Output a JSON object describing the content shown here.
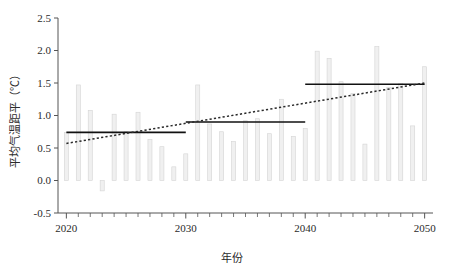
{
  "chart_data": {
    "type": "bar",
    "title": "",
    "xlabel": "年份",
    "ylabel": "平均气温距平（℃）",
    "xlim": [
      2019.3,
      2050.7
    ],
    "ylim": [
      -0.5,
      2.5
    ],
    "grid": false,
    "legend": null,
    "x_ticks_major": [
      "2020",
      "2030",
      "2040",
      "2050"
    ],
    "x_ticks_major_values": [
      2020,
      2030,
      2040,
      2050
    ],
    "y_ticks": [
      "-0.5",
      "0.0",
      "0.5",
      "1.0",
      "1.5",
      "2.0",
      "2.5"
    ],
    "y_tick_values": [
      -0.5,
      0.0,
      0.5,
      1.0,
      1.5,
      2.0,
      2.5
    ],
    "categories": [
      2020,
      2021,
      2022,
      2023,
      2024,
      2025,
      2026,
      2027,
      2028,
      2029,
      2030,
      2031,
      2032,
      2033,
      2034,
      2035,
      2036,
      2037,
      2038,
      2039,
      2040,
      2041,
      2042,
      2043,
      2044,
      2045,
      2046,
      2047,
      2048,
      2049,
      2050
    ],
    "values": [
      0.74,
      1.47,
      1.08,
      -0.16,
      1.02,
      0.75,
      1.05,
      0.63,
      0.52,
      0.21,
      0.41,
      1.47,
      0.87,
      0.75,
      0.6,
      0.92,
      0.95,
      0.72,
      1.25,
      0.68,
      0.8,
      1.99,
      1.88,
      1.52,
      1.34,
      0.56,
      2.06,
      1.43,
      1.49,
      0.84,
      1.75
    ],
    "series": [
      {
        "name": "平均气温距平",
        "type": "bar",
        "values": [
          0.74,
          1.47,
          1.08,
          -0.16,
          1.02,
          0.75,
          1.05,
          0.63,
          0.52,
          0.21,
          0.41,
          1.47,
          0.87,
          0.75,
          0.6,
          0.92,
          0.95,
          0.72,
          1.25,
          0.68,
          0.8,
          1.99,
          1.88,
          1.52,
          1.34,
          0.56,
          2.06,
          1.43,
          1.49,
          0.84,
          1.75
        ]
      },
      {
        "name": "阶段平均值",
        "type": "step-segments",
        "segments": [
          {
            "x_start": 2020,
            "x_end": 2030,
            "value": 0.74
          },
          {
            "x_start": 2030,
            "x_end": 2040,
            "value": 0.9
          },
          {
            "x_start": 2040,
            "x_end": 2050,
            "value": 1.48
          }
        ]
      },
      {
        "name": "线性趋势",
        "type": "trend-line",
        "style": "dotted",
        "x_start": 2020,
        "x_end": 2050,
        "y_start": 0.57,
        "y_end": 1.5
      }
    ],
    "colors": {
      "bar_fill": "#f0f0f0",
      "bar_stroke": "#d4d4d4",
      "mean_line": "#111111",
      "trend_line": "#2a2a2a",
      "axis": "#555555",
      "text": "#2b2b2b"
    }
  }
}
